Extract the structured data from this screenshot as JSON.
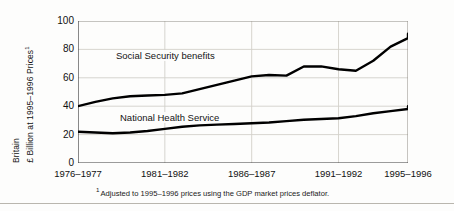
{
  "chart_data": {
    "type": "line",
    "title": "",
    "xlabel": "",
    "ylabel": "Britain £ Billion at 1995–1996 Prices",
    "ylim": [
      0,
      100
    ],
    "yticks": [
      0,
      20,
      40,
      60,
      80,
      100
    ],
    "grid": true,
    "legend_position": "inline-labels",
    "x_tick_labels": [
      "1976–1977",
      "1981–1982",
      "1986–1987",
      "1991–1992",
      "1995–1996"
    ],
    "x_tick_years": [
      1976,
      1981,
      1986,
      1991,
      1995
    ],
    "x": [
      1976,
      1977,
      1978,
      1979,
      1980,
      1981,
      1982,
      1983,
      1984,
      1985,
      1986,
      1987,
      1988,
      1989,
      1990,
      1991,
      1992,
      1993,
      1994,
      1995
    ],
    "series": [
      {
        "name": "Social Security benefits",
        "color": "#000000",
        "values": [
          40,
          43,
          45.5,
          47,
          47.5,
          48,
          49,
          52,
          55,
          58,
          61,
          62,
          61.5,
          68,
          68,
          66,
          65,
          72,
          82,
          88
        ]
      },
      {
        "name": "National Health Service",
        "color": "#000000",
        "values": [
          22,
          21.5,
          21,
          21.5,
          22.5,
          24,
          25.5,
          26.5,
          27,
          27.5,
          28,
          28.5,
          29.5,
          30.5,
          31,
          31.5,
          33,
          35,
          36.5,
          38
        ]
      }
    ],
    "series_end_values": [
      91,
      40
    ],
    "footnote": "Adjusted to 1995–1996 prices using the GDP market prices deflator.",
    "footnote_marker": "1"
  },
  "axis": {
    "y_title_line1": "Britain",
    "y_title_line2": "£ Billion at 1995–1996 Prices",
    "y_title_superscript": "1"
  }
}
